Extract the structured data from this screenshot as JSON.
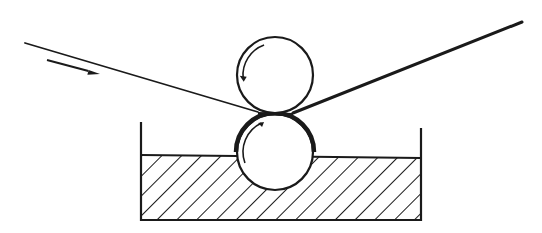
{
  "diagram": {
    "title": "",
    "colors": {
      "stroke": "#1a1a1a",
      "background": "#ffffff",
      "hatch": "#1a1a1a"
    },
    "web_in": {
      "x1": 25,
      "y1": 43,
      "x2": 258,
      "y2": 112
    },
    "web_out": {
      "x1": 293,
      "y1": 113,
      "x2": 522,
      "y2": 22
    },
    "direction_arrow": {
      "x1": 47,
      "y1": 60,
      "x2": 100,
      "y2": 74
    },
    "top_roller": {
      "cx": 275,
      "cy": 75,
      "r": 38,
      "rotation": "counterclockwise"
    },
    "bottom_roller": {
      "cx": 275,
      "cy": 152,
      "r": 38,
      "rotation": "clockwise"
    },
    "tank": {
      "left_x": 141,
      "right_x": 421,
      "top_left_y": 122,
      "top_right_y": 128,
      "bottom_y": 220,
      "liquid_left_y": 155,
      "liquid_right_y": 158
    }
  }
}
